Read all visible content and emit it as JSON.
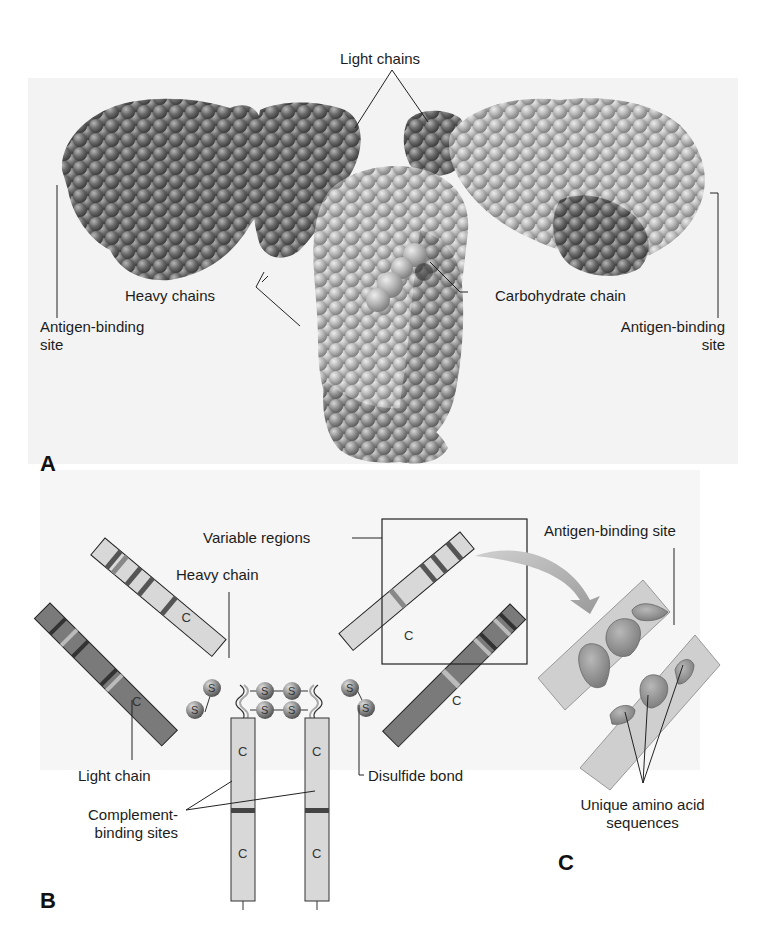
{
  "figure": {
    "panels": [
      {
        "id": "A",
        "letter": "A",
        "description": "Space-filling model of antibody molecule",
        "labels": {
          "light_chains": "Light chains",
          "heavy_chains": "Heavy chains",
          "carbohydrate_chain": "Carbohydrate chain",
          "antigen_binding_left_1": "Antigen-binding",
          "antigen_binding_left_2": "site",
          "antigen_binding_right_1": "Antigen-binding",
          "antigen_binding_right_2": "site"
        }
      },
      {
        "id": "B",
        "letter": "B",
        "description": "Schematic of antibody chains",
        "labels": {
          "variable_regions": "Variable regions",
          "heavy_chain": "Heavy chain",
          "light_chain": "Light chain",
          "complement_1": "Complement-",
          "complement_2": "binding sites",
          "disulfide_bond": "Disulfide bond"
        },
        "segment_glyphs": {
          "constant": "C",
          "sulfur": "S"
        }
      },
      {
        "id": "C",
        "letter": "C",
        "description": "Close-up of antigen-binding site",
        "labels": {
          "antigen_binding_site": "Antigen-binding site",
          "unique_1": "Unique amino acid",
          "unique_2": "sequences"
        }
      }
    ]
  },
  "colors": {
    "background": "#f3f3f3",
    "dark_chain": "#6e6e6e",
    "light_chain_fill": "#d8d8d8",
    "mid_chain": "#a0a0a0",
    "band_dark": "#505050",
    "band_light": "#c8c8c8",
    "line": "#222222"
  }
}
